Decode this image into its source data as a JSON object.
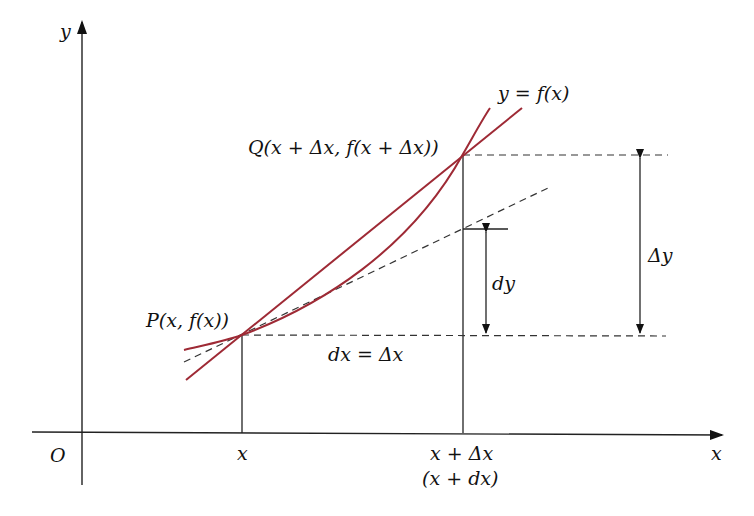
{
  "figure": {
    "axes": {
      "y_label": "y",
      "x_label": "x",
      "origin_label": "O"
    },
    "curve_label": "y = f(x)",
    "point_P_label": "P(x, f(x))",
    "point_Q_label": "Q(x + Δx, f(x + Δx))",
    "dx_label": "dx = Δx",
    "dy_label": "dy",
    "delta_y_label": "Δy",
    "x_tick_label": "x",
    "x_plus_dx_tick_label": "x + Δx",
    "x_plus_dx_alt_label": "(x + dx)",
    "colors": {
      "curve": "#9e2a35",
      "secant": "#9e2a35",
      "axes": "#222222",
      "dashed": "#333333"
    }
  }
}
